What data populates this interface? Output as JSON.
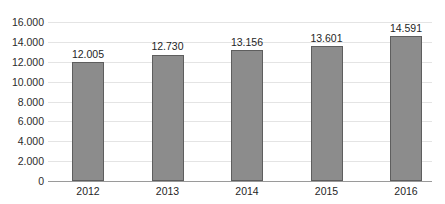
{
  "chart_data": {
    "type": "bar",
    "title": "",
    "subtitle": "",
    "xlabel": "",
    "ylabel": "",
    "categories": [
      "2012",
      "2013",
      "2014",
      "2015",
      "2016"
    ],
    "values": [
      12005,
      12730,
      13156,
      13601,
      14591
    ],
    "value_labels": [
      "12.005",
      "12.730",
      "13.156",
      "13.601",
      "14.591"
    ],
    "ylim": [
      0,
      16000
    ],
    "ytick_values": [
      0,
      2000,
      4000,
      6000,
      8000,
      10000,
      12000,
      14000,
      16000
    ],
    "ytick_labels": [
      "0",
      "2.000",
      "4.000",
      "6.000",
      "8.000",
      "10.000",
      "12.000",
      "14.000",
      "16.000"
    ],
    "grid": "horizontal",
    "legend": "none",
    "number_format": "period-thousands-separator",
    "colors": {
      "bar_fill": "#8c8c8c",
      "bar_border": "#5e5e5e",
      "gridline": "#e4e4e4",
      "axis_line": "#9a9a9a",
      "label_text": "#1f1f1f",
      "background": "#ffffff"
    }
  }
}
